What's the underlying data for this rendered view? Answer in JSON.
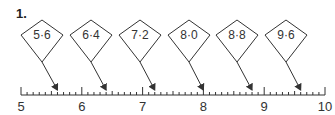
{
  "question": {
    "number": "1."
  },
  "number_line": {
    "start": 5,
    "end": 10,
    "minor_divisions_per_unit": 10,
    "major_labels": [
      "5",
      "6",
      "7",
      "8",
      "9",
      "10"
    ],
    "x_start_px": 21,
    "x_end_px": 325,
    "y_px": 95
  },
  "kites": [
    {
      "label": "5·6",
      "value": 5.6,
      "center_x": 42
    },
    {
      "label": "6·4",
      "value": 6.4,
      "center_x": 91
    },
    {
      "label": "7·2",
      "value": 7.2,
      "center_x": 140
    },
    {
      "label": "8·0",
      "value": 8.0,
      "center_x": 189
    },
    {
      "label": "8·8",
      "value": 8.8,
      "center_x": 237
    },
    {
      "label": "9·6",
      "value": 9.6,
      "center_x": 286
    }
  ],
  "colors": {
    "stroke": "#333333",
    "text": "#333333"
  }
}
